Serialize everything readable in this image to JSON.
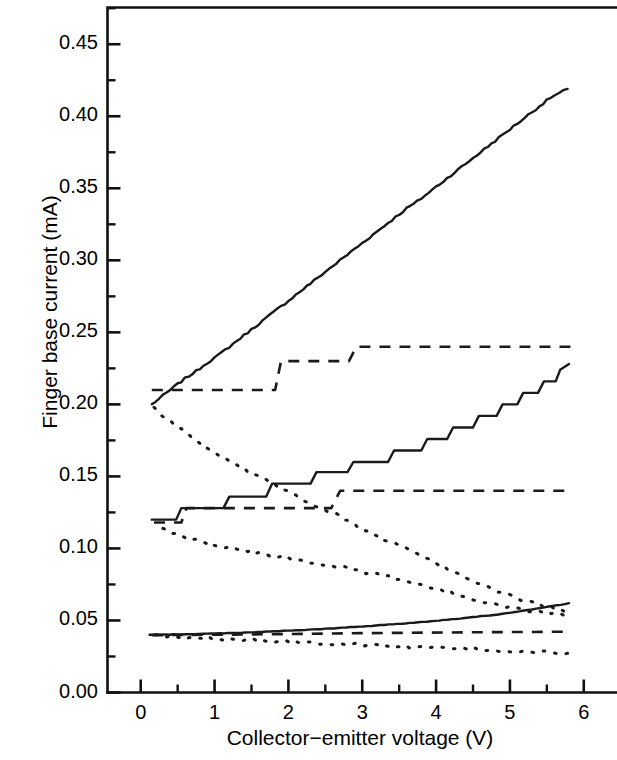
{
  "chart_data": {
    "type": "line",
    "title": "",
    "xlabel": "Collector−emitter voltage (V)",
    "ylabel": "Finger base current (mA)",
    "xlim": [
      -0.45,
      6.45
    ],
    "ylim": [
      0.0,
      0.4755
    ],
    "grid": false,
    "legend": "none",
    "xticks": [
      0,
      1,
      2,
      3,
      4,
      5,
      6
    ],
    "xtick_labels": [
      "0",
      "1",
      "2",
      "3",
      "4",
      "5",
      "6"
    ],
    "xminor_ticks": [
      -0.5,
      0.5,
      1.5,
      2.5,
      3.5,
      4.5,
      5.5
    ],
    "yticks": [
      0.0,
      0.05,
      0.1,
      0.15,
      0.2,
      0.25,
      0.3,
      0.35,
      0.4,
      0.45
    ],
    "ytick_labels": [
      "0.00",
      "0.05",
      "0.10",
      "0.15",
      "0.20",
      "0.25",
      "0.30",
      "0.35",
      "0.40",
      "0.45"
    ],
    "yminor_ticks": [
      0.025,
      0.075,
      0.125,
      0.175,
      0.225,
      0.275,
      0.325,
      0.375,
      0.425,
      0.475
    ],
    "series": [
      {
        "name": "upper-solid",
        "style": "solid",
        "color": "#1a1a1a",
        "points": [
          [
            0.15,
            0.2
          ],
          [
            0.3,
            0.206
          ],
          [
            0.45,
            0.212
          ],
          [
            0.6,
            0.218
          ],
          [
            0.75,
            0.223
          ],
          [
            0.9,
            0.229
          ],
          [
            1.05,
            0.234
          ],
          [
            1.2,
            0.24
          ],
          [
            1.35,
            0.246
          ],
          [
            1.5,
            0.252
          ],
          [
            1.65,
            0.258
          ],
          [
            1.8,
            0.264
          ],
          [
            1.95,
            0.27
          ],
          [
            2.1,
            0.276
          ],
          [
            2.25,
            0.282
          ],
          [
            2.4,
            0.288
          ],
          [
            2.55,
            0.294
          ],
          [
            2.7,
            0.3
          ],
          [
            2.85,
            0.306
          ],
          [
            3.0,
            0.312
          ],
          [
            3.15,
            0.318
          ],
          [
            3.3,
            0.324
          ],
          [
            3.45,
            0.33
          ],
          [
            3.6,
            0.336
          ],
          [
            3.75,
            0.341
          ],
          [
            3.9,
            0.347
          ],
          [
            4.05,
            0.353
          ],
          [
            4.2,
            0.359
          ],
          [
            4.35,
            0.365
          ],
          [
            4.5,
            0.371
          ],
          [
            4.65,
            0.377
          ],
          [
            4.8,
            0.383
          ],
          [
            4.95,
            0.389
          ],
          [
            5.1,
            0.395
          ],
          [
            5.25,
            0.401
          ],
          [
            5.4,
            0.407
          ],
          [
            5.55,
            0.413
          ],
          [
            5.78,
            0.419
          ]
        ]
      },
      {
        "name": "upper-dashed",
        "style": "dashed",
        "color": "#1a1a1a",
        "points": [
          [
            0.15,
            0.21
          ],
          [
            0.4,
            0.21
          ],
          [
            1.82,
            0.21
          ],
          [
            1.9,
            0.23
          ],
          [
            2.82,
            0.23
          ],
          [
            2.92,
            0.24
          ],
          [
            5.82,
            0.24
          ]
        ]
      },
      {
        "name": "upper-dotted",
        "style": "dotted",
        "color": "#1a1a1a",
        "points": [
          [
            0.18,
            0.197
          ],
          [
            0.45,
            0.186
          ],
          [
            0.7,
            0.177
          ],
          [
            0.95,
            0.169
          ],
          [
            1.2,
            0.161
          ],
          [
            1.45,
            0.154
          ],
          [
            1.7,
            0.148
          ],
          [
            1.95,
            0.141
          ],
          [
            2.2,
            0.134
          ],
          [
            2.45,
            0.128
          ],
          [
            2.7,
            0.122
          ],
          [
            2.95,
            0.115
          ],
          [
            3.2,
            0.109
          ],
          [
            3.45,
            0.103
          ],
          [
            3.7,
            0.097
          ],
          [
            3.95,
            0.091
          ],
          [
            4.2,
            0.085
          ],
          [
            4.45,
            0.079
          ],
          [
            4.7,
            0.073
          ],
          [
            4.95,
            0.068
          ],
          [
            5.2,
            0.064
          ],
          [
            5.45,
            0.06
          ],
          [
            5.78,
            0.057
          ]
        ]
      },
      {
        "name": "middle-solid",
        "style": "solid",
        "color": "#1a1a1a",
        "points": [
          [
            0.15,
            0.12
          ],
          [
            0.48,
            0.12
          ],
          [
            0.55,
            0.128
          ],
          [
            1.12,
            0.128
          ],
          [
            1.2,
            0.136
          ],
          [
            1.7,
            0.136
          ],
          [
            1.78,
            0.145
          ],
          [
            2.3,
            0.145
          ],
          [
            2.38,
            0.153
          ],
          [
            2.8,
            0.153
          ],
          [
            2.88,
            0.16
          ],
          [
            3.35,
            0.16
          ],
          [
            3.43,
            0.168
          ],
          [
            3.8,
            0.168
          ],
          [
            3.88,
            0.176
          ],
          [
            4.15,
            0.176
          ],
          [
            4.23,
            0.184
          ],
          [
            4.5,
            0.184
          ],
          [
            4.58,
            0.192
          ],
          [
            4.82,
            0.192
          ],
          [
            4.9,
            0.2
          ],
          [
            5.1,
            0.2
          ],
          [
            5.18,
            0.208
          ],
          [
            5.38,
            0.208
          ],
          [
            5.46,
            0.216
          ],
          [
            5.62,
            0.216
          ],
          [
            5.68,
            0.224
          ],
          [
            5.8,
            0.228
          ]
        ]
      },
      {
        "name": "middle-dashed",
        "style": "dashed",
        "color": "#1a1a1a",
        "points": [
          [
            0.18,
            0.118
          ],
          [
            0.55,
            0.118
          ],
          [
            0.62,
            0.128
          ],
          [
            2.58,
            0.128
          ],
          [
            2.7,
            0.14
          ],
          [
            5.82,
            0.14
          ]
        ]
      },
      {
        "name": "middle-dotted",
        "style": "dotted",
        "color": "#1a1a1a",
        "points": [
          [
            0.3,
            0.113
          ],
          [
            0.6,
            0.108
          ],
          [
            0.9,
            0.104
          ],
          [
            1.2,
            0.101
          ],
          [
            1.5,
            0.098
          ],
          [
            1.8,
            0.095
          ],
          [
            2.1,
            0.092
          ],
          [
            2.4,
            0.09
          ],
          [
            2.7,
            0.087
          ],
          [
            3.0,
            0.084
          ],
          [
            3.3,
            0.081
          ],
          [
            3.6,
            0.077
          ],
          [
            3.9,
            0.073
          ],
          [
            4.2,
            0.069
          ],
          [
            4.5,
            0.065
          ],
          [
            4.8,
            0.061
          ],
          [
            5.1,
            0.058
          ],
          [
            5.4,
            0.056
          ],
          [
            5.78,
            0.054
          ]
        ]
      },
      {
        "name": "lower-solid",
        "style": "solid",
        "color": "#1a1a1a",
        "points": [
          [
            0.12,
            0.04
          ],
          [
            0.5,
            0.0403
          ],
          [
            0.9,
            0.0408
          ],
          [
            1.3,
            0.0414
          ],
          [
            1.7,
            0.0422
          ],
          [
            2.1,
            0.0431
          ],
          [
            2.5,
            0.0442
          ],
          [
            2.9,
            0.0455
          ],
          [
            3.3,
            0.0469
          ],
          [
            3.7,
            0.0485
          ],
          [
            4.1,
            0.0503
          ],
          [
            4.5,
            0.0523
          ],
          [
            4.9,
            0.0546
          ],
          [
            5.3,
            0.0576
          ],
          [
            5.8,
            0.062
          ]
        ]
      },
      {
        "name": "lower-dashed",
        "style": "dashed",
        "color": "#1a1a1a",
        "points": [
          [
            0.15,
            0.0398
          ],
          [
            1.5,
            0.0403
          ],
          [
            3.0,
            0.0412
          ],
          [
            4.5,
            0.0418
          ],
          [
            5.82,
            0.0422
          ]
        ]
      },
      {
        "name": "lower-dotted",
        "style": "dotted",
        "color": "#1a1a1a",
        "points": [
          [
            0.2,
            0.0392
          ],
          [
            0.7,
            0.0382
          ],
          [
            1.2,
            0.0371
          ],
          [
            1.7,
            0.036
          ],
          [
            2.2,
            0.0349
          ],
          [
            2.7,
            0.0338
          ],
          [
            3.2,
            0.0327
          ],
          [
            3.7,
            0.0316
          ],
          [
            4.2,
            0.0305
          ],
          [
            4.7,
            0.0294
          ],
          [
            5.2,
            0.0283
          ],
          [
            5.78,
            0.0272
          ]
        ]
      }
    ]
  },
  "axes": {
    "x_title": "Collector−emitter voltage (V)",
    "y_title": "Finger base current (mA)"
  }
}
